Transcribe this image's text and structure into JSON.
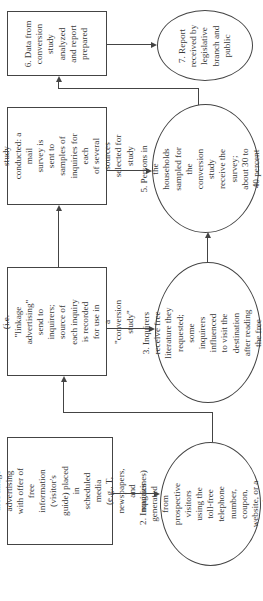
{
  "diagram": {
    "orientation": "rotated 90 degrees counter-clockwise",
    "nodes": [
      {
        "id": "1",
        "shape": "rectangle",
        "label": "1.  Destination marketer\nuses image advertising\nwith offer of free\ninformation (visitor's\nguide) placed in\nscheduled media\n(e.g., T, newspapers,\nand magazines)"
      },
      {
        "id": "2",
        "shape": "ellipse",
        "label": "2.  Inquiries generated\nfrom prospective visitors\nusing the toll-free\ntelephone number,\ncoupon, website, or a\nreader service card"
      },
      {
        "id": "3a",
        "shape": "rectangle",
        "label": "3.  Free literature (i.e.\n\"linkage advertising\"\nsend to inquirers;\nsource of each inquiry\nis recorded for use in\na \"conversion study\""
      },
      {
        "id": "3b",
        "shape": "ellipse",
        "label": "3.  Inquirers receive free\nliterature they requested;\nsome inquirers influenced\nto visit the destination\nafter reading the free\nliterature"
      },
      {
        "id": "4",
        "shape": "rectangle",
        "label": "4.  Conversion study\nconducted:  a mail\nsurvey is sent to\nsamples of\ninquiries for each\nof several sources\nselected for study"
      },
      {
        "id": "5",
        "shape": "ellipse",
        "label": "5.  Persons in the\nhouseholds sampled for\nthe conversion study\nreceive the survey;\nabout 30 to 40 percent\nrespond"
      },
      {
        "id": "6",
        "shape": "rectangle",
        "label": "6.  Data from\nconversion\nstudy analyzed\nand report\nprepared"
      },
      {
        "id": "7",
        "shape": "ellipse",
        "label": "7.  Report\nreceived by\nlegislative\nbranch and\npublic"
      }
    ],
    "edges": [
      {
        "from": "1",
        "to": "2"
      },
      {
        "from": "2",
        "to": "3a"
      },
      {
        "from": "3a",
        "to": "3b"
      },
      {
        "from": "3a",
        "to": "4"
      },
      {
        "from": "3b",
        "to": "5"
      },
      {
        "from": "4",
        "to": "5"
      },
      {
        "from": "5",
        "to": "6"
      },
      {
        "from": "6",
        "to": "7"
      }
    ]
  }
}
